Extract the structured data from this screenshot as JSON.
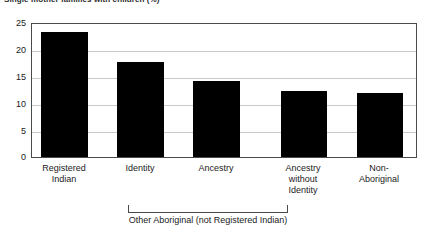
{
  "chart_data": {
    "type": "bar",
    "title": "Single mother families with children (%)",
    "xlabel": "",
    "ylabel": "",
    "categories": [
      "Registered Indian",
      "Identity",
      "Ancestry",
      "Ancestry without Identity",
      "Non-Aboriginal"
    ],
    "category_lines": [
      [
        "Registered",
        "Indian"
      ],
      [
        "Identity"
      ],
      [
        "Ancestry"
      ],
      [
        "Ancestry",
        "without",
        "Identity"
      ],
      [
        "Non-",
        "Aboriginal"
      ]
    ],
    "values": [
      23.4,
      17.7,
      14.2,
      12.3,
      12.0
    ],
    "ylim": [
      0,
      25
    ],
    "yticks": [
      0,
      5,
      10,
      15,
      20,
      25
    ],
    "ytick_labels": [
      "0",
      "5",
      "10",
      "15",
      "20",
      "25"
    ],
    "grid": true,
    "legend": false,
    "bar_color": "#000000",
    "gridline_color": "#c9c9c9",
    "frame_color": "#4a4a4a",
    "annotations": [
      {
        "name": "group-bracket",
        "text": "Other Aboriginal (not Registered Indian)",
        "spans_categories": [
          "Identity",
          "Ancestry",
          "Ancestry without Identity"
        ]
      }
    ]
  },
  "axis": {
    "y_ticks": [
      "25",
      "20",
      "15",
      "10",
      "5",
      "0"
    ]
  },
  "bracket": {
    "label": "Other Aboriginal (not Registered Indian)"
  }
}
